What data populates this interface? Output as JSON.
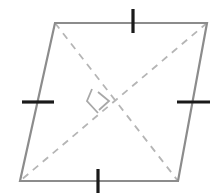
{
  "figure": {
    "name": "rhombus-with-perpendicular-diagonals",
    "canvas": {
      "width": 212,
      "height": 195,
      "background": "#ffffff"
    },
    "colors": {
      "outline": "#8c8c8c",
      "diagonal": "#b5b5b5",
      "tick": "#1a1a1a",
      "right_angle": "#a8a8a8",
      "background": "#ffffff"
    },
    "strokes": {
      "outline_width": 2.2,
      "diagonal_width": 1.8,
      "diagonal_dash": "7 6",
      "tick_width": 3.2,
      "right_angle_width": 1.8
    },
    "vertices": {
      "top_left": {
        "label": "A",
        "x": 55,
        "y": 23
      },
      "top_right": {
        "label": "B",
        "x": 207,
        "y": 23
      },
      "bottom_right": {
        "label": "C",
        "x": 178,
        "y": 181
      },
      "bottom_left": {
        "label": "D",
        "x": 20,
        "y": 181
      }
    },
    "outline_path": "M 55 23 L 207 23 L 178 181 L 20 181 Z",
    "diagonals": [
      {
        "name": "diagonal-top-left-to-bottom-right",
        "from": "top_left",
        "to": "bottom_right",
        "path": "M 55 23 L 178 181"
      },
      {
        "name": "diagonal-top-right-to-bottom-left",
        "from": "top_right",
        "to": "bottom_left",
        "path": "M 207 23 L 20 181"
      }
    ],
    "intersection": {
      "x": 99,
      "y": 102
    },
    "right_angle_marker": {
      "name": "right-angle-square",
      "path": "M 92 89 L 87 101 L 98 113 M 98 92 L 109 101 L 99 110",
      "note": "small square marker indicating perpendicular diagonals"
    },
    "tick_marks": [
      {
        "name": "tick-top-side",
        "side": "top",
        "orientation": "vertical",
        "center": {
          "x": 133,
          "y": 22
        },
        "path": "M 133 9 L 133 33"
      },
      {
        "name": "tick-right-side",
        "side": "right",
        "orientation": "horizontal",
        "center": {
          "x": 193,
          "y": 102
        },
        "path": "M 177 102 L 210 102"
      },
      {
        "name": "tick-bottom-side",
        "side": "bottom",
        "orientation": "vertical",
        "center": {
          "x": 98,
          "y": 181
        },
        "path": "M 98 169 L 98 193"
      },
      {
        "name": "tick-left-side",
        "side": "left",
        "orientation": "horizontal",
        "center": {
          "x": 38,
          "y": 102
        },
        "path": "M 22 102 L 54 102"
      }
    ]
  }
}
